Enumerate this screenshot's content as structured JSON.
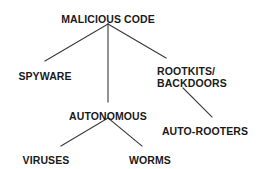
{
  "diagram": {
    "type": "hierarchy-tree",
    "title": "MALICIOUS CODE",
    "background_color": "#ffffff",
    "line_color": "#3a3a3a",
    "text_color": "#1a1a1a",
    "nodes": {
      "root": {
        "label": "MALICIOUS CODE",
        "x": 108,
        "y": 14
      },
      "spyware": {
        "label": "SPYWARE",
        "x": 45,
        "y": 71
      },
      "rootkits": {
        "label_line1": "ROOTKITS/",
        "label_line2": "BACKDOORS",
        "x": 157,
        "y": 66
      },
      "autonomous": {
        "label": "AUTONOMOUS",
        "x": 108,
        "y": 111
      },
      "auto_rooters": {
        "label": "AUTO-ROOTERS",
        "x": 205,
        "y": 126
      },
      "viruses": {
        "label": "VIRUSES",
        "x": 46,
        "y": 155
      },
      "worms": {
        "label": "WORMS",
        "x": 150,
        "y": 155
      }
    },
    "edges": [
      {
        "from": "root",
        "to": "spyware",
        "x1": 108,
        "y1": 24,
        "x2": 45,
        "y2": 61
      },
      {
        "from": "root",
        "to": "autonomous",
        "x1": 108,
        "y1": 24,
        "x2": 108,
        "y2": 102
      },
      {
        "from": "root",
        "to": "rootkits",
        "x1": 108,
        "y1": 24,
        "x2": 166,
        "y2": 58
      },
      {
        "from": "rootkits",
        "to": "auto_rooters",
        "x1": 183,
        "y1": 88,
        "x2": 212,
        "y2": 117
      },
      {
        "from": "autonomous",
        "to": "viruses",
        "x1": 108,
        "y1": 118,
        "x2": 61,
        "y2": 146
      },
      {
        "from": "autonomous",
        "to": "worms",
        "x1": 108,
        "y1": 118,
        "x2": 142,
        "y2": 146
      }
    ]
  }
}
